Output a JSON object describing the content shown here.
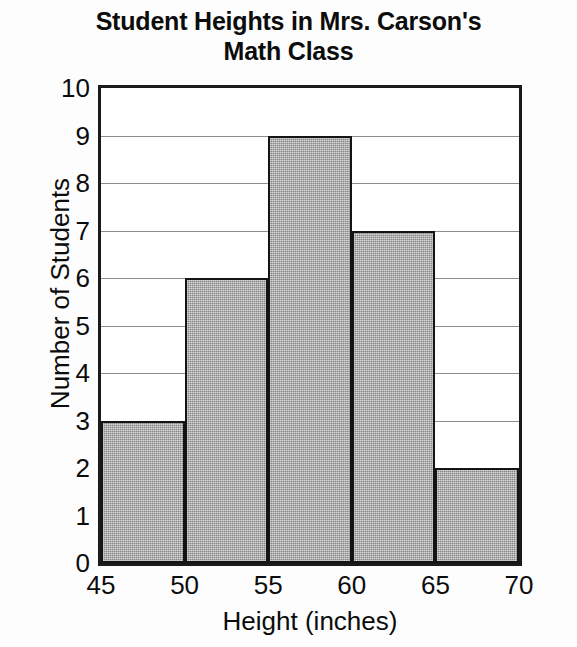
{
  "chart_data": {
    "type": "bar",
    "title": "Student Heights in Mrs. Carson's Math Class",
    "title_lines": [
      "Student Heights in Mrs. Carson's",
      "Math Class"
    ],
    "xlabel": "Height (inches)",
    "ylabel": "Number of Students",
    "categories": [
      "45-50",
      "50-55",
      "55-60",
      "60-65",
      "65-70"
    ],
    "bin_edges": [
      45,
      50,
      55,
      60,
      65,
      70
    ],
    "values": [
      3,
      6,
      9,
      7,
      2
    ],
    "xlim": [
      45,
      70
    ],
    "ylim": [
      0,
      10
    ],
    "xticks": [
      45,
      50,
      55,
      60,
      65,
      70
    ],
    "yticks": [
      0,
      1,
      2,
      3,
      4,
      5,
      6,
      7,
      8,
      9,
      10
    ],
    "xtick_labels": [
      "45",
      "50",
      "55",
      "60",
      "65",
      "70"
    ],
    "ytick_labels": [
      "0",
      "1",
      "2",
      "3",
      "4",
      "5",
      "6",
      "7",
      "8",
      "9",
      "10"
    ],
    "grid": "horizontal",
    "legend": "none",
    "bar_fill_color": "#a9a9a9",
    "bar_edge_color": "#141414",
    "gridline_color": "#8d8d8d",
    "axis_color": "#1a1a1a",
    "background_color": "#ffffff"
  }
}
